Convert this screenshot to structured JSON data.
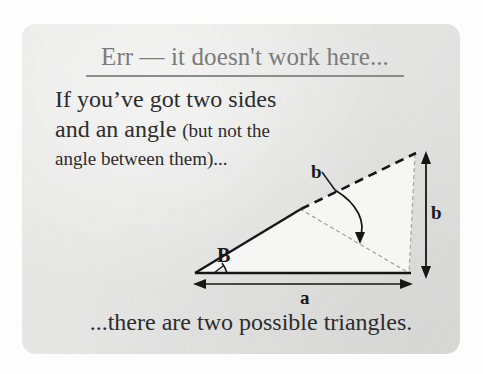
{
  "card": {
    "background_color": "#e4e4e3",
    "page_background_color": "#fdfdfd"
  },
  "heading": {
    "text": "Err — it doesn't work here...",
    "color": "#7b7b7b",
    "underlined": true
  },
  "body": {
    "line1": "If you’ve got two sides",
    "line2_main": "and an angle ",
    "line2_paren": "(but not the",
    "line3": "angle between them)...",
    "color": "#2c2c2c"
  },
  "closing": {
    "text": "...there are two possible triangles."
  },
  "figure": {
    "caption_kind": "ambiguous-case-ssa-triangle",
    "labels": {
      "angle_B": "B",
      "side_a": "a",
      "side_b_arc": "b",
      "side_b_right": "b"
    },
    "colors": {
      "solid_stroke": "#1a1a1a",
      "dashed_stroke": "#1a1a1a",
      "faint_stroke": "#9a9a9a",
      "fill": "#f4f4f3"
    },
    "geometry": {
      "left_vertex": [
        195,
        271
      ],
      "base_right_vertex": [
        409,
        271
      ],
      "top_apex": [
        415,
        152
      ],
      "low_apex": [
        409,
        271
      ],
      "solid_break": [
        300,
        207
      ],
      "arc_from": [
        312,
        188
      ],
      "arc_to": [
        352,
        238
      ]
    }
  }
}
